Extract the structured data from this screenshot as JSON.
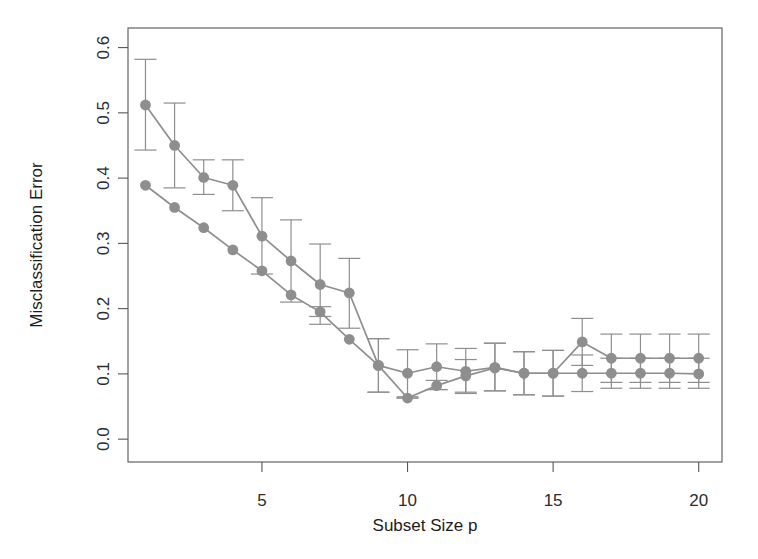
{
  "chart_data": {
    "type": "line",
    "title": "",
    "xlabel": "Subset Size p",
    "ylabel": "Misclassification Error",
    "xlim": [
      0.4,
      20.8
    ],
    "ylim": [
      -0.035,
      0.63
    ],
    "grid": false,
    "legend": null,
    "series_color": "#8e8e8e",
    "error_bars": true,
    "x": [
      1,
      2,
      3,
      4,
      5,
      6,
      7,
      8,
      9,
      10,
      11,
      12,
      13,
      14,
      15,
      16,
      17,
      18,
      19,
      20
    ],
    "series": [
      {
        "name": "upper-curve",
        "values": [
          0.512,
          0.45,
          0.401,
          0.389,
          0.311,
          0.273,
          0.237,
          0.224,
          0.113,
          0.101,
          0.111,
          0.104,
          0.11,
          0.101,
          0.101,
          0.149,
          0.124,
          0.124,
          0.124,
          0.124
        ],
        "err_low": [
          0.443,
          0.385,
          0.375,
          0.35,
          0.253,
          0.21,
          0.176,
          0.17,
          0.072,
          0.065,
          0.076,
          0.07,
          0.074,
          0.068,
          0.066,
          0.113,
          0.087,
          0.087,
          0.087,
          0.087
        ],
        "err_high": [
          0.582,
          0.515,
          0.428,
          0.428,
          0.37,
          0.336,
          0.299,
          0.277,
          0.154,
          0.137,
          0.146,
          0.139,
          0.147,
          0.134,
          0.136,
          0.185,
          0.161,
          0.161,
          0.161,
          0.161
        ]
      },
      {
        "name": "lower-curve",
        "values": [
          0.389,
          0.355,
          0.324,
          0.29,
          0.258,
          0.221,
          0.195,
          0.153,
          0.113,
          0.063,
          0.082,
          0.097,
          0.109,
          0.101,
          0.101,
          0.101,
          0.101,
          0.101,
          0.101,
          0.1
        ],
        "err_low": [
          null,
          null,
          null,
          null,
          null,
          null,
          0.188,
          null,
          0.072,
          0.063,
          0.076,
          0.072,
          0.074,
          0.068,
          0.066,
          0.073,
          0.078,
          0.078,
          0.078,
          0.078
        ],
        "err_high": [
          null,
          null,
          null,
          null,
          null,
          null,
          0.203,
          null,
          0.154,
          0.063,
          0.09,
          0.122,
          0.147,
          0.134,
          0.136,
          0.129,
          0.124,
          0.124,
          0.124,
          0.124
        ]
      }
    ],
    "yticks": [
      0.0,
      0.1,
      0.2,
      0.3,
      0.4,
      0.5,
      0.6
    ],
    "ytick_labels": [
      "0.0",
      "0.1",
      "0.2",
      "0.3",
      "0.4",
      "0.5",
      "0.6"
    ],
    "xticks": [
      5,
      10,
      15,
      20
    ],
    "xtick_labels": [
      "5",
      "10",
      "15",
      "20"
    ]
  }
}
